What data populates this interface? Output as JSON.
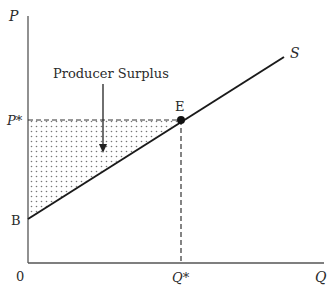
{
  "diagram": {
    "title": "Producer Surplus",
    "axes": {
      "y_label": "P",
      "x_label": "Q",
      "origin_label": "0"
    },
    "points": {
      "equilibrium_label": "E",
      "intercept_label": "B",
      "price_label": "P*",
      "quantity_label": "Q*"
    },
    "curve": {
      "supply_label": "S"
    },
    "annotation": {
      "text": "Producer Surplus"
    },
    "colors": {
      "line": "#1a1a1a",
      "dot_fill": "#888888",
      "text": "#2b2b2b"
    }
  }
}
